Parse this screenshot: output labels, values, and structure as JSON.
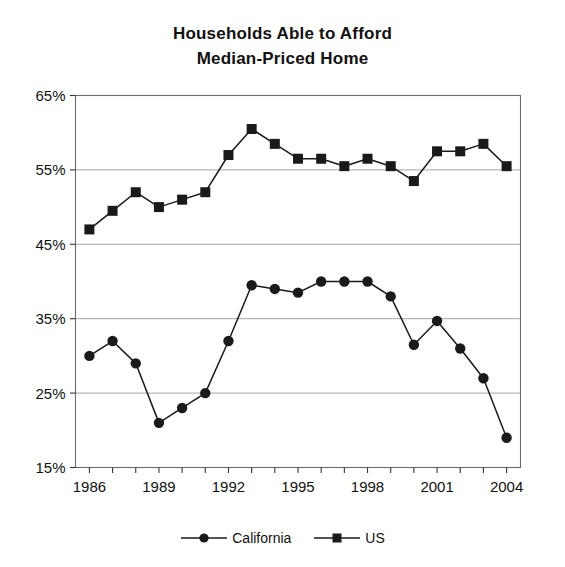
{
  "chart_data": {
    "type": "line",
    "title": "Households Able to Afford Median-Priced Home",
    "title_line1": "Households Able to Afford",
    "title_line2": "Median-Priced Home",
    "xlabel": "",
    "ylabel": "",
    "x": [
      1986,
      1987,
      1988,
      1989,
      1990,
      1991,
      1992,
      1993,
      1994,
      1995,
      1996,
      1997,
      1998,
      1999,
      2000,
      2001,
      2002,
      2003,
      2004
    ],
    "xtick_values": [
      1986,
      1989,
      1992,
      1995,
      1998,
      2001,
      2004
    ],
    "xtick_labels": [
      "1986",
      "1989",
      "1992",
      "1995",
      "1998",
      "2001",
      "2004"
    ],
    "xlim": [
      1985.4,
      2004.6
    ],
    "ytick_values": [
      15,
      25,
      35,
      45,
      55,
      65
    ],
    "ytick_labels": [
      "15%",
      "25%",
      "35%",
      "45%",
      "55%",
      "65%"
    ],
    "ylim": [
      15,
      65
    ],
    "grid": true,
    "grid_axis": "y",
    "legend_position": "bottom",
    "series": [
      {
        "name": "California",
        "marker": "circle",
        "color": "#1a1a1a",
        "values": [
          30.0,
          32.0,
          29.0,
          21.0,
          23.0,
          25.0,
          32.0,
          39.5,
          39.0,
          38.5,
          40.0,
          40.0,
          40.0,
          38.0,
          31.5,
          34.7,
          31.0,
          27.0,
          19.0
        ]
      },
      {
        "name": "US",
        "marker": "square",
        "color": "#1a1a1a",
        "values": [
          47.0,
          49.5,
          52.0,
          50.0,
          51.0,
          52.0,
          57.0,
          60.5,
          58.5,
          56.5,
          56.5,
          55.5,
          56.5,
          55.5,
          53.5,
          57.5,
          57.5,
          58.5,
          55.5
        ]
      }
    ]
  },
  "legend": {
    "items": [
      {
        "label": "California",
        "marker": "circle"
      },
      {
        "label": "US",
        "marker": "square"
      }
    ]
  }
}
